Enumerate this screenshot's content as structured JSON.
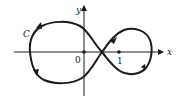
{
  "figure": {
    "curve_label": "C",
    "x_axis_label": "x",
    "y_axis_label": "y",
    "origin_label": "0",
    "tick_label": "1",
    "curve_shape": "figure-eight (lemniscate-like)",
    "orientation": "left lobe counterclockwise, right lobe clockwise",
    "colors": {
      "stroke": "#1a1a1a",
      "background": "#ffffff"
    }
  }
}
